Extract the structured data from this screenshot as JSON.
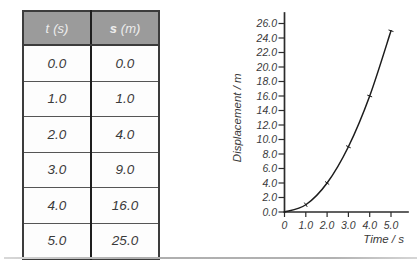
{
  "table": {
    "headers": [
      {
        "symbol": "t",
        "unit": "(s)"
      },
      {
        "symbol": "s",
        "unit": "(m)"
      }
    ],
    "rows": [
      [
        "0.0",
        "0.0"
      ],
      [
        "1.0",
        "1.0"
      ],
      [
        "2.0",
        "4.0"
      ],
      [
        "3.0",
        "9.0"
      ],
      [
        "4.0",
        "16.0"
      ],
      [
        "5.0",
        "25.0"
      ]
    ]
  },
  "chart_data": {
    "type": "line",
    "title": "",
    "xlabel": "Time / s",
    "ylabel": "Displacement / m",
    "x": [
      0.0,
      1.0,
      2.0,
      3.0,
      4.0,
      5.0
    ],
    "y": [
      0.0,
      1.0,
      4.0,
      9.0,
      16.0,
      25.0
    ],
    "x_tick_labels": [
      "0",
      "1.0",
      "2.0",
      "3.0",
      "4.0",
      "5.0"
    ],
    "x_tick_values": [
      0,
      1,
      2,
      3,
      4,
      5
    ],
    "y_tick_labels": [
      "0.0",
      "2.0",
      "4.0",
      "6.0",
      "8.0",
      "10.0",
      "12.0",
      "14.0",
      "16.0",
      "18.0",
      "20.0",
      "22.0",
      "24.0",
      "26.0"
    ],
    "y_tick_values": [
      0,
      2,
      4,
      6,
      8,
      10,
      12,
      14,
      16,
      18,
      20,
      22,
      24,
      26
    ],
    "xlim": [
      0,
      5.3
    ],
    "ylim": [
      0,
      27.5
    ],
    "grid": false,
    "legend": null,
    "line_color": "#1c1c1c",
    "marker_style": "perpendicular-dash"
  },
  "colors": {
    "header_bg": "#9b9b9b",
    "header_text": "#ededed",
    "table_border": "#3c3c3c",
    "column_divider": "#1e1e1e",
    "body_text": "#3a3a3a",
    "axis": "#2b2b2b",
    "curve": "#1c1c1c",
    "bottom_rule": "#b2b2b2"
  }
}
